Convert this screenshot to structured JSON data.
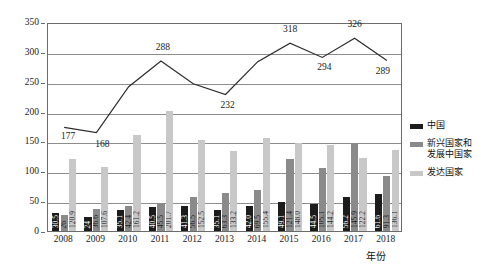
{
  "chart_data": {
    "type": "bar",
    "title": "",
    "xlabel": "年份",
    "ylabel": "投资金额/(×10亿美元)",
    "ylim": [
      0,
      350
    ],
    "ytick_values": [
      0,
      50,
      100,
      150,
      200,
      250,
      300,
      350
    ],
    "ytick_labels": [
      "0",
      "50",
      "100",
      "150",
      "200",
      "250",
      "300",
      "350"
    ],
    "grid": true,
    "legend_position": "right",
    "categories": [
      "2008",
      "2009",
      "2010",
      "2011",
      "2012",
      "2013",
      "2014",
      "2015",
      "2016",
      "2017",
      "2018"
    ],
    "series": [
      {
        "name": "中国",
        "kind": "bar",
        "color": "#1c1c1c",
        "values": [
          30.5,
          24,
          35.1,
          40.5,
          41.3,
          35.1,
          42.0,
          49.1,
          44.5,
          56.2,
          61.6
        ],
        "labels": [
          "30.5",
          "24",
          "35.1",
          "40.5",
          "41.3",
          "35.1",
          "42.0",
          "49.1",
          "44.5",
          "56.2",
          "61.6"
        ]
      },
      {
        "name": "新兴国家和发展中国家",
        "kind": "bar",
        "color": "#8a8a8a",
        "values": [
          26,
          36.6,
          42.4,
          45.5,
          56.5,
          63.3,
          69.5,
          121.4,
          105.1,
          145.9,
          91.3
        ],
        "labels": [
          "26",
          "36.6",
          "42.4",
          "45.5",
          "56.5",
          "63.3",
          "69.5",
          "121.4",
          "105.1",
          "145.9",
          "91.3"
        ]
      },
      {
        "name": "发达国家",
        "kind": "bar",
        "color": "#c8c8c8",
        "values": [
          120.9,
          107.6,
          161.2,
          201.7,
          152.5,
          133.2,
          155.4,
          148.0,
          144.2,
          122.2,
          136.1
        ],
        "labels": [
          "120.9",
          "107.6",
          "161.2",
          "201.7",
          "152.5",
          "133.2",
          "155.4",
          "148.0",
          "144.2",
          "122.2",
          "136.1"
        ]
      },
      {
        "name": "总计",
        "kind": "line",
        "color": "#2b2b2b",
        "values": [
          177,
          168,
          245,
          288,
          250,
          232,
          287,
          318,
          294,
          326,
          289
        ],
        "labels": [
          "177",
          "168",
          "",
          "288",
          "",
          "232",
          "",
          "318",
          "294",
          "326",
          "289"
        ]
      }
    ]
  },
  "legend": {
    "items": [
      {
        "label": "中国",
        "color": "#1c1c1c"
      },
      {
        "label": "新兴国家和\n发展中国家",
        "label_line1": "新兴国家和",
        "label_line2": "发展中国家",
        "color": "#8a8a8a"
      },
      {
        "label": "发达国家",
        "color": "#c8c8c8"
      }
    ]
  },
  "axes": {
    "y_title": "投资金额/(×10亿美元)",
    "x_title": "年份"
  }
}
